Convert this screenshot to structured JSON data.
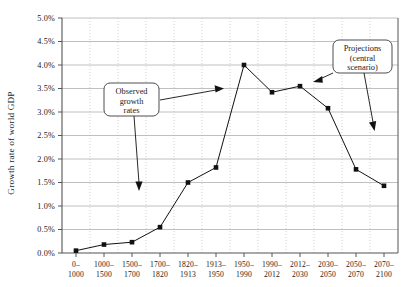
{
  "chart_data": {
    "type": "line",
    "title": "",
    "subtitle": "",
    "xlabel": "",
    "ylabel": "Growth rate of world GDP",
    "ylim": [
      0.0,
      5.0
    ],
    "y_unit": "%",
    "grid": true,
    "legend": "none",
    "y_ticks": [
      "0.0%",
      "0.5%",
      "1.0%",
      "1.5%",
      "2.0%",
      "2.5%",
      "3.0%",
      "3.5%",
      "4.0%",
      "4.5%",
      "5.0%"
    ],
    "y_tick_values": [
      0.0,
      0.5,
      1.0,
      1.5,
      2.0,
      2.5,
      3.0,
      3.5,
      4.0,
      4.5,
      5.0
    ],
    "categories": [
      "0-\n1000",
      "1000-\n1500",
      "1500-\n1700",
      "1700-\n1820",
      "1820-\n1913",
      "1913-\n1950",
      "1950-\n1990",
      "1990-\n2012",
      "2012-\n2030",
      "2030-\n2050",
      "2050-\n2070",
      "2070-\n2100"
    ],
    "categories_line1": [
      "0–",
      "1000–",
      "1500–",
      "1700–",
      "1820–",
      "1913–",
      "1950–",
      "1990–",
      "2012–",
      "2030–",
      "2050–",
      "2070–"
    ],
    "categories_line2": [
      "1000",
      "1500",
      "1700",
      "1820",
      "1913",
      "1950",
      "1990",
      "2012",
      "2030",
      "2050",
      "2070",
      "2100"
    ],
    "values": [
      0.05,
      0.18,
      0.23,
      0.55,
      1.5,
      1.82,
      4.0,
      3.42,
      3.55,
      3.08,
      1.78,
      1.43
    ],
    "series": [
      {
        "name": "Growth rate of world GDP",
        "values": [
          0.05,
          0.18,
          0.23,
          0.55,
          1.5,
          1.82,
          4.0,
          3.42,
          3.55,
          3.08,
          1.78,
          1.43
        ],
        "color": "#111111",
        "marker": "square"
      }
    ],
    "annotations": [
      {
        "id": "observed",
        "label_line1": "Observed",
        "label_line2": "growth",
        "label_line3": "rates"
      },
      {
        "id": "projections",
        "label_line1": "Projections",
        "label_line2": "(central",
        "label_line3": "scenario)"
      }
    ],
    "colors": {
      "line": "#111111",
      "marker": "#111111",
      "grid_horizontal": "#b0b0b0",
      "grid_vertical": "#bcbcbc",
      "axis": "#555555",
      "background": "#ffffff",
      "text": "#1a1a1a"
    }
  }
}
